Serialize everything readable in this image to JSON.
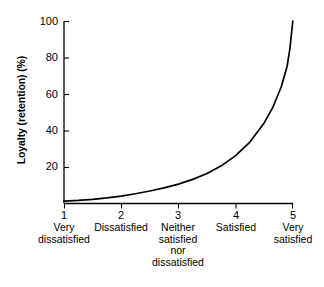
{
  "chart_data": {
    "type": "line",
    "title": "",
    "xlabel": "",
    "ylabel": "Loyalty (retention) (%)",
    "xlim": [
      1,
      5
    ],
    "ylim": [
      0,
      100
    ],
    "grid": false,
    "legend": null,
    "x_tick_values": [
      "1",
      "2",
      "3",
      "4",
      "5"
    ],
    "x_tick_captions": [
      "Very\ndissatisfied",
      "Dissatisfied",
      "Neither\nsatisfied\nnor\ndissatisfied",
      "Satisfied",
      "Very\nsatisfied"
    ],
    "y_tick_values": [
      "20",
      "40",
      "60",
      "80",
      "100"
    ],
    "series": [
      {
        "name": "Loyalty vs satisfaction",
        "color": "#000000",
        "x": [
          1.0,
          1.25,
          1.5,
          1.75,
          2.0,
          2.25,
          2.5,
          2.75,
          3.0,
          3.25,
          3.5,
          3.75,
          4.0,
          4.25,
          4.5,
          4.65,
          4.8,
          4.9,
          4.95,
          5.0
        ],
        "values": [
          1,
          1.4,
          2,
          2.8,
          3.8,
          5.1,
          6.6,
          8.3,
          10.4,
          13.0,
          16.2,
          20.4,
          26.0,
          33.5,
          44.0,
          52.5,
          64.0,
          75.0,
          85.0,
          100
        ]
      }
    ]
  },
  "axes": {
    "y_title": "Loyalty (retention) (%)",
    "y_ticks": [
      {
        "label": "100",
        "value": 100
      },
      {
        "label": "80",
        "value": 80
      },
      {
        "label": "60",
        "value": 60
      },
      {
        "label": "40",
        "value": 40
      },
      {
        "label": "20",
        "value": 20
      }
    ],
    "x_ticks": [
      {
        "number": "1",
        "caption": "Very\ndissatisfied"
      },
      {
        "number": "2",
        "caption": "Dissatisfied"
      },
      {
        "number": "3",
        "caption": "Neither\nsatisfied\nnor\ndissatisfied"
      },
      {
        "number": "4",
        "caption": "Satisfied"
      },
      {
        "number": "5",
        "caption": "Very\nsatisfied"
      }
    ]
  },
  "style": {
    "axis_color": "#000000",
    "curve_color": "#000000",
    "background": "#ffffff"
  }
}
